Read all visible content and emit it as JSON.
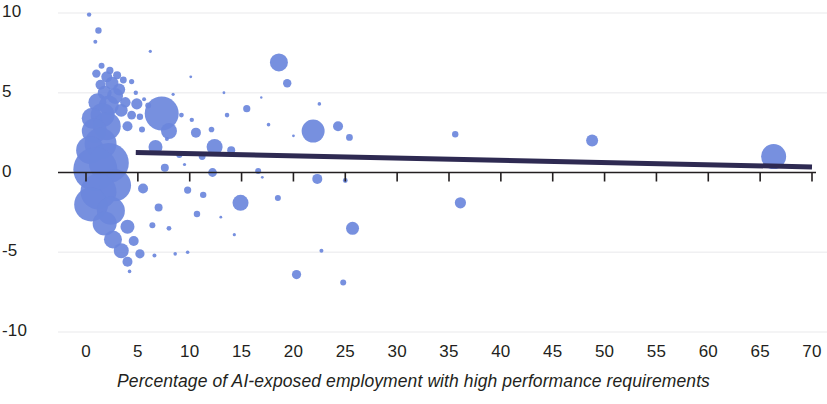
{
  "chart_data": {
    "type": "scatter",
    "title": "",
    "subtitle": "",
    "xlabel": "Percentage of AI-exposed employment with high performance requirements",
    "ylabel": "",
    "xlim": [
      0,
      70
    ],
    "ylim": [
      -10,
      10
    ],
    "xticks": [
      0,
      5,
      10,
      15,
      20,
      25,
      30,
      35,
      40,
      45,
      50,
      55,
      60,
      65,
      70
    ],
    "xtick_labels": [
      "0",
      "5",
      "10",
      "15",
      "20",
      "25",
      "30",
      "35",
      "40",
      "45",
      "50",
      "55",
      "60",
      "65",
      "70"
    ],
    "yticks": [
      10,
      5,
      0,
      -5,
      -10
    ],
    "ytick_labels": [
      "10",
      "5",
      "0",
      "-5",
      "-10"
    ],
    "grid": "horizontal-faint",
    "legend": "none",
    "marker_color": "#6b87dc",
    "marker_opacity": 0.92,
    "axis_color": "#231f20",
    "gridline_color": "#f0f0f2",
    "trendline": {
      "color": "#2e2a52",
      "width": 5,
      "x_start": 4.8,
      "x_end": 70,
      "y_start": 1.25,
      "y_end": 0.35
    },
    "points": [
      {
        "x": 0.3,
        "y": 9.9,
        "r": 2.2
      },
      {
        "x": 1.2,
        "y": 8.9,
        "r": 3.2
      },
      {
        "x": 0.9,
        "y": 8.2,
        "r": 2.0
      },
      {
        "x": 1.5,
        "y": 6.7,
        "r": 3.0
      },
      {
        "x": 2.3,
        "y": 6.4,
        "r": 3.6
      },
      {
        "x": 1.0,
        "y": 6.2,
        "r": 4.2
      },
      {
        "x": 2.0,
        "y": 6.0,
        "r": 5.5
      },
      {
        "x": 3.0,
        "y": 6.1,
        "r": 4.0
      },
      {
        "x": 2.5,
        "y": 5.6,
        "r": 6.5
      },
      {
        "x": 1.4,
        "y": 5.5,
        "r": 5.0
      },
      {
        "x": 3.6,
        "y": 5.8,
        "r": 3.4
      },
      {
        "x": 4.4,
        "y": 5.7,
        "r": 2.6
      },
      {
        "x": 3.2,
        "y": 5.2,
        "r": 6.0
      },
      {
        "x": 1.8,
        "y": 5.0,
        "r": 7.0
      },
      {
        "x": 2.8,
        "y": 4.8,
        "r": 8.0
      },
      {
        "x": 4.8,
        "y": 5.0,
        "r": 2.2
      },
      {
        "x": 5.6,
        "y": 4.6,
        "r": 2.0
      },
      {
        "x": 1.1,
        "y": 4.4,
        "r": 9.0
      },
      {
        "x": 2.2,
        "y": 4.2,
        "r": 10.0
      },
      {
        "x": 3.8,
        "y": 4.4,
        "r": 5.2
      },
      {
        "x": 4.9,
        "y": 4.3,
        "r": 5.6
      },
      {
        "x": 6.0,
        "y": 4.2,
        "r": 3.0
      },
      {
        "x": 3.4,
        "y": 3.9,
        "r": 6.4
      },
      {
        "x": 1.6,
        "y": 3.6,
        "r": 12.0
      },
      {
        "x": 0.6,
        "y": 3.4,
        "r": 10.5
      },
      {
        "x": 4.4,
        "y": 3.6,
        "r": 4.4
      },
      {
        "x": 5.2,
        "y": 3.5,
        "r": 3.2
      },
      {
        "x": 7.3,
        "y": 3.7,
        "r": 17.0
      },
      {
        "x": 9.2,
        "y": 3.6,
        "r": 2.4
      },
      {
        "x": 10.2,
        "y": 3.3,
        "r": 2.2
      },
      {
        "x": 2.0,
        "y": 2.9,
        "r": 14.0
      },
      {
        "x": 0.8,
        "y": 2.6,
        "r": 12.5
      },
      {
        "x": 4.0,
        "y": 2.9,
        "r": 5.0
      },
      {
        "x": 5.4,
        "y": 2.7,
        "r": 3.0
      },
      {
        "x": 8.0,
        "y": 2.6,
        "r": 8.0
      },
      {
        "x": 10.6,
        "y": 2.5,
        "r": 5.0
      },
      {
        "x": 12.1,
        "y": 2.7,
        "r": 2.8
      },
      {
        "x": 18.6,
        "y": 6.9,
        "r": 9.0
      },
      {
        "x": 19.4,
        "y": 5.6,
        "r": 4.2
      },
      {
        "x": 22.5,
        "y": 4.3,
        "r": 1.8
      },
      {
        "x": 15.5,
        "y": 4.0,
        "r": 3.6
      },
      {
        "x": 13.6,
        "y": 3.6,
        "r": 2.3
      },
      {
        "x": 21.9,
        "y": 2.6,
        "r": 11.5
      },
      {
        "x": 24.3,
        "y": 2.9,
        "r": 5.0
      },
      {
        "x": 25.4,
        "y": 2.2,
        "r": 3.4
      },
      {
        "x": 35.6,
        "y": 2.4,
        "r": 3.2
      },
      {
        "x": 48.8,
        "y": 2.0,
        "r": 6.0
      },
      {
        "x": 12.4,
        "y": 1.6,
        "r": 8.0
      },
      {
        "x": 14.0,
        "y": 1.4,
        "r": 4.0
      },
      {
        "x": 1.4,
        "y": 1.8,
        "r": 16.0
      },
      {
        "x": 0.4,
        "y": 1.4,
        "r": 14.0
      },
      {
        "x": 6.7,
        "y": 1.6,
        "r": 7.0
      },
      {
        "x": 9.0,
        "y": 1.1,
        "r": 3.0
      },
      {
        "x": 11.2,
        "y": 1.0,
        "r": 3.4
      },
      {
        "x": 66.3,
        "y": 1.0,
        "r": 12.5
      },
      {
        "x": 2.2,
        "y": 0.6,
        "r": 20.0
      },
      {
        "x": 0.9,
        "y": 0.2,
        "r": 22.0
      },
      {
        "x": 7.6,
        "y": 0.3,
        "r": 4.0
      },
      {
        "x": 12.2,
        "y": 0.0,
        "r": 4.4
      },
      {
        "x": 16.6,
        "y": 0.1,
        "r": 3.0
      },
      {
        "x": 22.3,
        "y": -0.4,
        "r": 5.0
      },
      {
        "x": 25.0,
        "y": -0.5,
        "r": 2.4
      },
      {
        "x": 2.8,
        "y": -0.8,
        "r": 16.0
      },
      {
        "x": 1.2,
        "y": -1.2,
        "r": 18.0
      },
      {
        "x": 5.5,
        "y": -1.0,
        "r": 5.0
      },
      {
        "x": 9.8,
        "y": -1.1,
        "r": 3.6
      },
      {
        "x": 11.3,
        "y": -1.4,
        "r": 3.2
      },
      {
        "x": 14.9,
        "y": -1.9,
        "r": 8.0
      },
      {
        "x": 18.5,
        "y": -1.6,
        "r": 3.0
      },
      {
        "x": 36.1,
        "y": -1.9,
        "r": 5.6
      },
      {
        "x": 0.5,
        "y": -2.0,
        "r": 17.0
      },
      {
        "x": 2.4,
        "y": -2.4,
        "r": 14.0
      },
      {
        "x": 7.0,
        "y": -2.2,
        "r": 4.0
      },
      {
        "x": 10.7,
        "y": -2.6,
        "r": 3.2
      },
      {
        "x": 1.8,
        "y": -3.2,
        "r": 12.0
      },
      {
        "x": 4.0,
        "y": -3.4,
        "r": 7.0
      },
      {
        "x": 6.4,
        "y": -3.3,
        "r": 3.0
      },
      {
        "x": 8.0,
        "y": -3.5,
        "r": 2.4
      },
      {
        "x": 25.7,
        "y": -3.5,
        "r": 6.5
      },
      {
        "x": 2.6,
        "y": -4.2,
        "r": 9.0
      },
      {
        "x": 4.6,
        "y": -4.3,
        "r": 5.0
      },
      {
        "x": 3.4,
        "y": -4.9,
        "r": 7.5
      },
      {
        "x": 5.2,
        "y": -5.1,
        "r": 4.6
      },
      {
        "x": 4.0,
        "y": -5.6,
        "r": 5.0
      },
      {
        "x": 6.6,
        "y": -5.2,
        "r": 2.0
      },
      {
        "x": 8.6,
        "y": -5.1,
        "r": 1.8
      },
      {
        "x": 9.8,
        "y": -5.0,
        "r": 1.8
      },
      {
        "x": 22.7,
        "y": -4.9,
        "r": 2.0
      },
      {
        "x": 4.2,
        "y": -6.2,
        "r": 1.8
      },
      {
        "x": 20.3,
        "y": -6.4,
        "r": 4.6
      },
      {
        "x": 24.8,
        "y": -6.9,
        "r": 3.0
      },
      {
        "x": 14.3,
        "y": -3.9,
        "r": 1.6
      },
      {
        "x": 6.2,
        "y": 7.6,
        "r": 1.6
      },
      {
        "x": 16.9,
        "y": 4.7,
        "r": 1.2
      },
      {
        "x": 13.3,
        "y": 5.0,
        "r": 1.4
      },
      {
        "x": 8.4,
        "y": 4.9,
        "r": 1.6
      },
      {
        "x": 10.1,
        "y": 6.0,
        "r": 1.4
      },
      {
        "x": 17.6,
        "y": 3.0,
        "r": 1.8
      },
      {
        "x": 20.0,
        "y": 2.3,
        "r": 1.4
      },
      {
        "x": 9.5,
        "y": 0.5,
        "r": 1.6
      },
      {
        "x": 17.0,
        "y": -0.3,
        "r": 1.4
      },
      {
        "x": 13.0,
        "y": -2.8,
        "r": 1.4
      },
      {
        "x": 7.8,
        "y": 2.1,
        "r": 2.0
      }
    ]
  }
}
